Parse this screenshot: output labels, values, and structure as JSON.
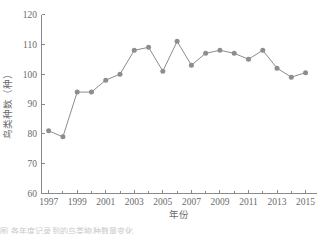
{
  "figure": {
    "background_color": "#ffffff",
    "line_color": "#8d8d8d",
    "marker_color": "#8d8d8d",
    "axis_color": "#8a8a8a",
    "text_color": "#6b6b6b"
  },
  "axes": {
    "x_title": "年份",
    "y_title": "鸟类种数（种）",
    "x_tick_labels": [
      "1997",
      "1999",
      "2001",
      "2003",
      "2005",
      "2007",
      "2009",
      "2011",
      "2013",
      "2015"
    ],
    "y_tick_labels": [
      "60",
      "70",
      "80",
      "90",
      "100",
      "110",
      "120"
    ]
  },
  "caption": {
    "text": "图  各年度记录到的鸟类物种数量变化"
  },
  "chart_data": {
    "type": "line",
    "title": "",
    "xlabel": "年份",
    "ylabel": "鸟类种数（种）",
    "xlim": [
      1996.5,
      2015.8
    ],
    "ylim": [
      60,
      120
    ],
    "xticks": [
      1997,
      1999,
      2001,
      2003,
      2005,
      2007,
      2009,
      2011,
      2013,
      2015
    ],
    "yticks": [
      60,
      70,
      80,
      90,
      100,
      110,
      120
    ],
    "grid": false,
    "legend": false,
    "marker": "circle",
    "x": [
      1997,
      1998,
      1999,
      2000,
      2001,
      2002,
      2003,
      2004,
      2005,
      2006,
      2007,
      2008,
      2009,
      2010,
      2011,
      2012,
      2013,
      2014,
      2015
    ],
    "series": [
      {
        "name": "鸟类种数",
        "values": [
          81,
          79,
          94,
          94,
          98,
          100,
          108,
          109,
          101,
          111,
          103,
          107,
          108,
          107,
          105,
          108,
          102,
          99,
          100.5
        ]
      }
    ]
  }
}
